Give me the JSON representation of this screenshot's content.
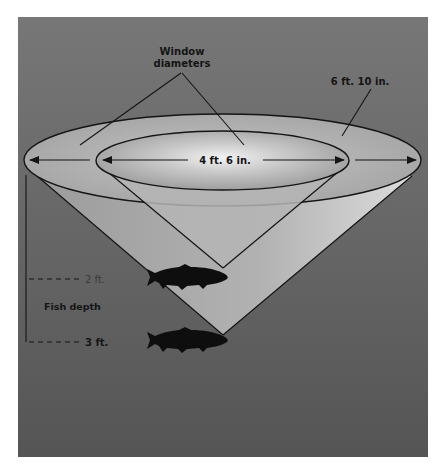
{
  "diagram": {
    "labels": {
      "window_diameters_line1": "Window",
      "window_diameters_line2": "diameters",
      "outer_diameter": "6 ft. 10 in.",
      "inner_diameter": "4 ft. 6 in.",
      "fish_depth": "Fish depth",
      "depth_shallow": "2 ft.",
      "depth_deep": "3 ft."
    },
    "icons": {
      "fish": "trout-silhouette"
    },
    "colors": {
      "background_top": "#757575",
      "background_bottom": "#555555",
      "ellipse_fill": "#a9a9a9",
      "cone_fill": "#b3b3b3",
      "glow_center": "#e8e8e8",
      "ink": "#151515"
    }
  }
}
